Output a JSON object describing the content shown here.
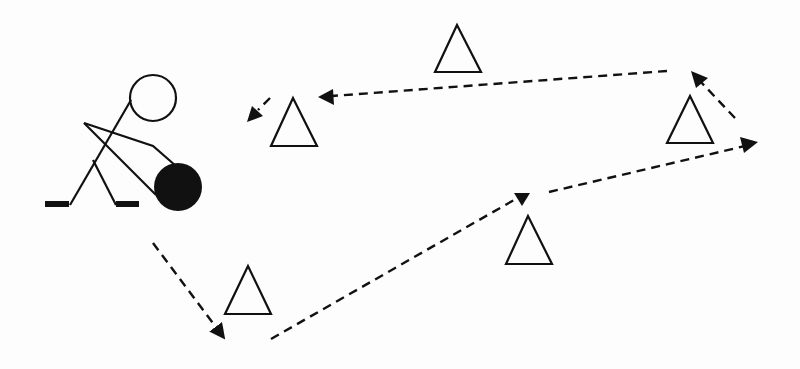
{
  "diagram": {
    "colors": {
      "background": "#fdfdfd",
      "ink": "#111111"
    },
    "player": {
      "head": {
        "cx": 153,
        "cy": 98,
        "r": 23
      },
      "puck": {
        "cx": 178,
        "cy": 187,
        "r": 24
      }
    },
    "cones": [
      {
        "id": "cone-1",
        "x": 295,
        "y": 98
      },
      {
        "id": "cone-2",
        "x": 458,
        "y": 25
      },
      {
        "id": "cone-3",
        "x": 690,
        "y": 96
      },
      {
        "id": "cone-4",
        "x": 529,
        "y": 216
      },
      {
        "id": "cone-5",
        "x": 248,
        "y": 266
      }
    ],
    "route": [
      {
        "id": "leg-1",
        "from": [
          153,
          243
        ],
        "to": [
          222,
          338
        ]
      },
      {
        "id": "leg-2",
        "from": [
          271,
          339
        ],
        "to": [
          526,
          193
        ]
      },
      {
        "id": "leg-3",
        "from": [
          549,
          192
        ],
        "to": [
          757,
          143
        ]
      },
      {
        "id": "leg-4",
        "from": [
          735,
          118
        ],
        "to": [
          692,
          72
        ]
      },
      {
        "id": "leg-5",
        "from": [
          667,
          71
        ],
        "to": [
          318,
          97
        ]
      },
      {
        "id": "leg-6",
        "from": [
          270,
          98
        ],
        "to": [
          248,
          121
        ]
      }
    ]
  }
}
